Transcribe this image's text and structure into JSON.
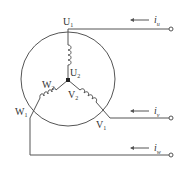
{
  "diagram": {
    "title": "",
    "type": "three-phase star (Y) winding connection",
    "terminals": {
      "U1": {
        "letter": "U",
        "sub": "1"
      },
      "U2": {
        "letter": "U",
        "sub": "2"
      },
      "V1": {
        "letter": "V",
        "sub": "1"
      },
      "V2": {
        "letter": "V",
        "sub": "2"
      },
      "W1": {
        "letter": "W",
        "sub": "1"
      },
      "W2": {
        "letter": "W",
        "sub": "2"
      }
    },
    "currents": {
      "iu": {
        "letter": "i",
        "sub": "u"
      },
      "iv": {
        "letter": "i",
        "sub": "v"
      },
      "iw": {
        "letter": "i",
        "sub": "w"
      }
    },
    "colors": {
      "line": "#555555",
      "text": "#333333",
      "background": "#ffffff"
    }
  }
}
